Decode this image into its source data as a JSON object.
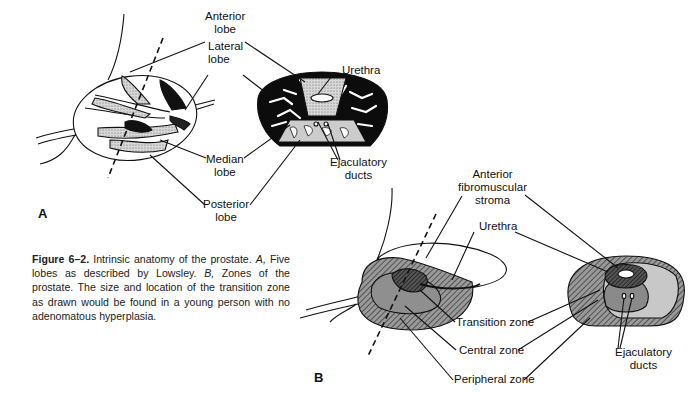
{
  "figure": {
    "number": "Figure 6–2.",
    "caption_intro": "Intrinsic anatomy of the prostate.",
    "caption_a_marker": "A,",
    "caption_a_text": "Five lobes as described by Lowsley.",
    "caption_b_marker": "B,",
    "caption_b_text": "Zones of the prostate. The size and location of the transition zone as drawn would be found in a young person with no adenomatous hyperplasia."
  },
  "panel_a": {
    "letter": "A",
    "labels": {
      "anterior_lobe": [
        "Anterior",
        "lobe"
      ],
      "lateral_lobe": [
        "Lateral",
        "lobe"
      ],
      "median_lobe": [
        "Median",
        "lobe"
      ],
      "posterior_lobe": [
        "Posterior",
        "lobe"
      ],
      "urethra": "Urethra",
      "ejaculatory_ducts": [
        "Ejaculatory",
        "ducts"
      ]
    }
  },
  "panel_b": {
    "letter": "B",
    "labels": {
      "anterior_fibromuscular_stroma": [
        "Anterior",
        "fibromuscular",
        "stroma"
      ],
      "urethra": "Urethra",
      "transition_zone": "Transition zone",
      "central_zone": "Central zone",
      "peripheral_zone": "Peripheral zone",
      "ejaculatory_ducts": [
        "Ejaculatory",
        "ducts"
      ]
    }
  }
}
